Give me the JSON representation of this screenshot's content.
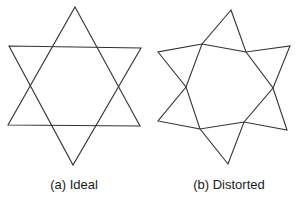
{
  "figures": [
    {
      "caption": "(a) Ideal",
      "caption_x": 74,
      "triangles": [
        [
          [
            75,
            7
          ],
          [
            140,
            126
          ],
          [
            8,
            125
          ]
        ],
        [
          [
            9,
            46
          ],
          [
            141,
            48
          ],
          [
            73,
            165
          ]
        ]
      ]
    },
    {
      "caption": "(b) Distorted",
      "caption_x": 229,
      "outline": [
        [
          231,
          10
        ],
        [
          246,
          52
        ],
        [
          290,
          46
        ],
        [
          273,
          88
        ],
        [
          287,
          130
        ],
        [
          244,
          122
        ],
        [
          228,
          164
        ],
        [
          200,
          129
        ],
        [
          158,
          121
        ],
        [
          186,
          87
        ],
        [
          158,
          52
        ],
        [
          202,
          44
        ]
      ],
      "inner_hexagon": [
        [
          202,
          44
        ],
        [
          246,
          52
        ],
        [
          273,
          88
        ],
        [
          244,
          122
        ],
        [
          200,
          129
        ],
        [
          186,
          87
        ]
      ]
    }
  ],
  "stroke_color": "#333333"
}
